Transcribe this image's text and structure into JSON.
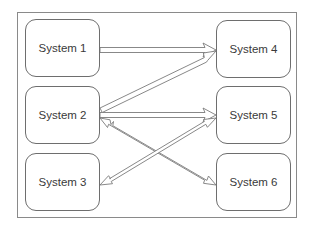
{
  "diagram": {
    "type": "system-interaction-diagram",
    "nodes": [
      {
        "id": "s1",
        "label": "System 1"
      },
      {
        "id": "s2",
        "label": "System 2"
      },
      {
        "id": "s3",
        "label": "System 3"
      },
      {
        "id": "s4",
        "label": "System 4"
      },
      {
        "id": "s5",
        "label": "System 5"
      },
      {
        "id": "s6",
        "label": "System 6"
      }
    ],
    "edges": [
      {
        "from": "s1",
        "to": "s4",
        "direction": "one-way"
      },
      {
        "from": "s2",
        "to": "s4",
        "direction": "one-way"
      },
      {
        "from": "s2",
        "to": "s5",
        "direction": "one-way"
      },
      {
        "from": "s2",
        "to": "s6",
        "direction": "two-way"
      },
      {
        "from": "s3",
        "to": "s5",
        "direction": "two-way"
      }
    ],
    "colors": {
      "stroke": "#6e6e6e",
      "frame": "#8a8a8a",
      "text": "#3a3a3a",
      "background": "#ffffff"
    }
  }
}
